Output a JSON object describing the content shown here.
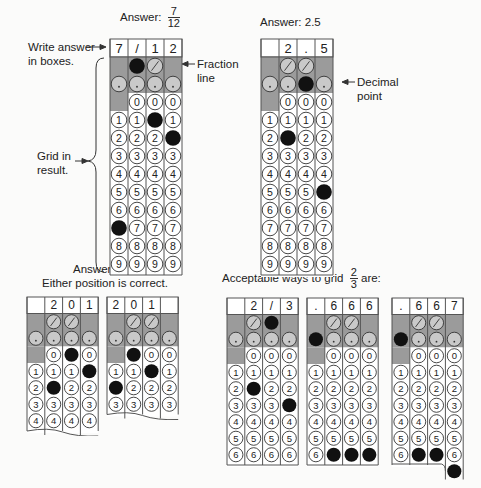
{
  "labels": {
    "answer_7_12_prefix": "Answer:",
    "answer_7_12_num": "7",
    "answer_7_12_den": "12",
    "answer_2_5": "Answer: 2.5",
    "write_answer_line1": "Write answer",
    "write_answer_line2": "in boxes.",
    "fraction_line_1": "Fraction",
    "fraction_line_2": "line",
    "decimal_point_1": "Decimal",
    "decimal_point_2": "point",
    "grid_in_1": "Grid in",
    "grid_in_2": "result.",
    "answer_201": "Answer: 201",
    "either_position": "Either position is correct.",
    "acceptable_prefix": "Acceptable ways to grid",
    "acceptable_num": "2",
    "acceptable_den": "3",
    "acceptable_suffix": "are:"
  },
  "colors": {
    "shade": "#9b9b9b",
    "border": "#555555",
    "fill": "#111111",
    "paper": "#ffffff"
  },
  "grids": [
    {
      "id": "grid-7-12",
      "x": 109,
      "y": 38,
      "cw": 18,
      "rh": 18,
      "rows": 10,
      "boxes": [
        "7",
        "/",
        "1",
        "2"
      ],
      "filled": {
        "0": 7,
        "1": "slash",
        "2": 1,
        "3": 2
      },
      "torn": false
    },
    {
      "id": "grid-2-5",
      "x": 260,
      "y": 38,
      "cw": 18,
      "rh": 18,
      "rows": 10,
      "boxes": [
        "",
        "2",
        ".",
        "5"
      ],
      "filled": {
        "1": 2,
        "2": "dot",
        "3": 5
      },
      "torn": false
    },
    {
      "id": "grid-201-right",
      "x": 26,
      "y": 296,
      "cw": 17.8,
      "rh": 16.5,
      "rows": 5,
      "boxes": [
        "",
        "2",
        "0",
        "1"
      ],
      "filled": {
        "1": 2,
        "2": 0,
        "3": 1
      },
      "torn": true
    },
    {
      "id": "grid-201-left",
      "x": 106,
      "y": 296,
      "cw": 17.8,
      "rh": 16.5,
      "rows": 4,
      "boxes": [
        "2",
        "0",
        "1",
        ""
      ],
      "filled": {
        "0": 2,
        "1": 0,
        "2": 1
      },
      "torn": true
    },
    {
      "id": "grid-2-3-fraction",
      "x": 226,
      "y": 297,
      "cw": 17.8,
      "rh": 16.5,
      "rows": 7,
      "boxes": [
        "",
        "2",
        "/",
        "3"
      ],
      "filled": {
        "1": 2,
        "2": "slash",
        "3": 3
      },
      "torn": false
    },
    {
      "id": "grid-666",
      "x": 306,
      "y": 297,
      "cw": 17.8,
      "rh": 16.5,
      "rows": 7,
      "boxes": [
        ".",
        "6",
        "6",
        "6"
      ],
      "filled": {
        "0": "dot",
        "1": 6,
        "2": 6,
        "3": 6
      },
      "torn": false
    },
    {
      "id": "grid-667",
      "x": 391,
      "y": 297,
      "cw": 17.8,
      "rh": 16.5,
      "rows": 7,
      "boxes": [
        ".",
        "6",
        "6",
        "7"
      ],
      "filled": {
        "0": "dot",
        "1": 6,
        "2": 6,
        "3": 7
      },
      "torn": false,
      "overflow_col": 3
    }
  ]
}
